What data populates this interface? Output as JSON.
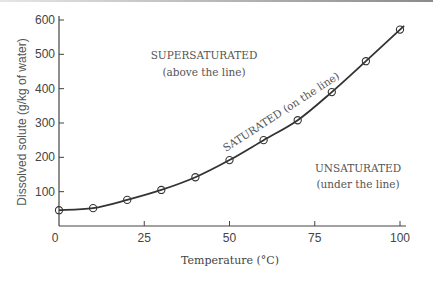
{
  "chart_data": {
    "type": "line",
    "title": "",
    "xlabel": "Temperature (°C)",
    "ylabel": "Dissolved solute (g/kg of water)",
    "xlim": [
      0,
      100
    ],
    "ylim": [
      0,
      600
    ],
    "x_ticks": [
      0,
      25,
      50,
      75,
      100
    ],
    "x_tick_labels": [
      "0",
      "25",
      "50",
      "75",
      "100"
    ],
    "y_ticks": [
      100,
      200,
      300,
      400,
      500,
      600
    ],
    "y_tick_labels": [
      "100",
      "200",
      "300",
      "400",
      "500",
      "600"
    ],
    "grid": false,
    "legend": null,
    "series": [
      {
        "name": "Solubility curve",
        "marker": "open-circle",
        "x": [
          0,
          10,
          20,
          30,
          40,
          50,
          60,
          70,
          80,
          90,
          100
        ],
        "values": [
          46,
          52,
          76,
          105,
          142,
          192,
          250,
          308,
          390,
          480,
          572
        ]
      }
    ],
    "annotations": [
      {
        "text": "SUPERSATURATED",
        "subtext": "(above the line)"
      },
      {
        "text": "SATURATED (on the line)"
      },
      {
        "text": "UNSATURATED",
        "subtext": "(under the line)"
      }
    ]
  },
  "labels": {
    "xlabel": "Temperature (°C)",
    "ylabel": "Dissolved solute (g/kg of water)",
    "x_ticks": [
      "0",
      "25",
      "50",
      "75",
      "100"
    ],
    "y_ticks": [
      "100",
      "200",
      "300",
      "400",
      "500",
      "600"
    ],
    "super_title": "SUPERSATURATED",
    "super_sub": "(above the line)",
    "saturated": "SATURATED (on the line)",
    "unsat_title": "UNSATURATED",
    "unsat_sub": "(under the line)"
  },
  "colors": {
    "line": "#333333",
    "axis": "#444444",
    "text": "#555555"
  }
}
